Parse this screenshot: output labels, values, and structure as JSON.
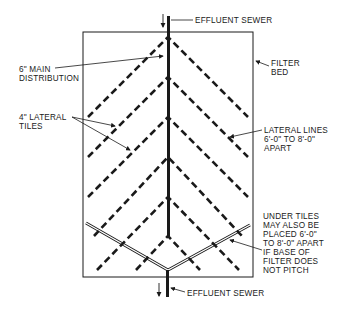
{
  "diagram": {
    "type": "filter-bed-underdrain-plan",
    "colors": {
      "ink": "#1a1a1a",
      "background": "#ffffff"
    },
    "labels": {
      "effluent_sewer_top": "EFFLUENT SEWER",
      "main_distribution": [
        "6\" MAIN",
        "DISTRIBUTION"
      ],
      "filter_bed": [
        "FILTER",
        "BED"
      ],
      "lateral_tiles": [
        "4\" LATERAL",
        "TILES"
      ],
      "lateral_lines": [
        "LATERAL LINES",
        "6'-0\" TO 8'-0\"",
        "APART"
      ],
      "under_tiles_note": [
        "UNDER TILES",
        "MAY ALSO BE",
        "PLACED 6'-0\"",
        "TO 8'-0\" APART",
        "IF BASE OF",
        "FILTER DOES",
        "NOT PITCH"
      ],
      "effluent_sewer_bottom": "EFFLUENT SEWER"
    },
    "components": [
      "filter-bed-outline",
      "main-distribution-pipe",
      "lateral-tile-chevrons",
      "under-tile-v-drain",
      "inlet-arrow",
      "outlet-arrow"
    ]
  }
}
